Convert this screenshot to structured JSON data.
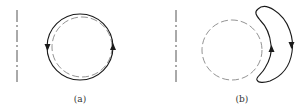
{
  "figure": {
    "panels": [
      {
        "id": "a",
        "label": "(a)",
        "description": "Closed circular loop (solid) around a dashed circle, with a downward arrow on the left side and an upward arrow on the right side, next to a dash-dot vertical axis."
      },
      {
        "id": "b",
        "label": "(b)",
        "description": "Dashed circle with a crescent-shaped closed loop (solid) on its right side; upward arrow on the inner edge and downward arrow on the outer edge, next to a dash-dot vertical axis."
      }
    ],
    "colors": {
      "stroke": "#1a1a1a",
      "dashed": "#777777",
      "axis": "#555555"
    }
  }
}
